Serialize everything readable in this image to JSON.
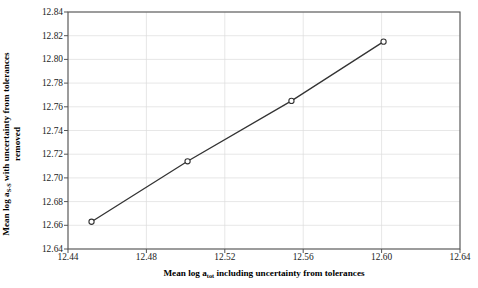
{
  "chart_data": {
    "type": "line",
    "title": "",
    "xlabel_plain": "Mean log a_tot including uncertainty from tolerances",
    "ylabel_plain": "Mean log a_S-S with uncertainty from tolerances removed",
    "xlabel_parts": {
      "pre": "Mean log a",
      "sub": "tot",
      "post": " including uncertainty from tolerances"
    },
    "ylabel_parts": {
      "pre": "Mean log a",
      "sub": "S-S",
      "post": " with uncertainty from tolerances",
      "line2": "removed"
    },
    "x": [
      12.452,
      12.501,
      12.554,
      12.601
    ],
    "values": [
      12.663,
      12.714,
      12.765,
      12.815
    ],
    "xlim": [
      12.44,
      12.64
    ],
    "ylim": [
      12.64,
      12.84
    ],
    "xticks": [
      "12.44",
      "12.48",
      "12.52",
      "12.56",
      "12.60",
      "12.64"
    ],
    "xtick_values": [
      12.44,
      12.48,
      12.52,
      12.56,
      12.6,
      12.64
    ],
    "yticks": [
      "12.64",
      "12.66",
      "12.68",
      "12.70",
      "12.72",
      "12.74",
      "12.76",
      "12.78",
      "12.80",
      "12.82",
      "12.84"
    ],
    "ytick_values": [
      12.64,
      12.66,
      12.68,
      12.7,
      12.72,
      12.74,
      12.76,
      12.78,
      12.8,
      12.82,
      12.84
    ],
    "grid": true,
    "legend": null,
    "marker": "open-circle",
    "line_color": "#333333",
    "grid_color": "#dcdcdc",
    "axis_color": "#555555"
  }
}
